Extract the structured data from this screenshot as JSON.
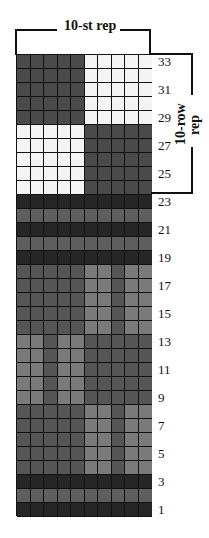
{
  "chart": {
    "column_rep_label": "10-st rep",
    "row_rep_label_line1": "10-row",
    "row_rep_label_line2": "rep",
    "columns": 10,
    "rows": 33,
    "row_labels": [
      "33",
      "31",
      "29",
      "27",
      "25",
      "23",
      "21",
      "19",
      "17",
      "15",
      "13",
      "11",
      "9",
      "7",
      "5",
      "3",
      "1"
    ]
  },
  "colors": {
    "white": "#f4f4f4",
    "dark": "#4a4a4a",
    "very_dark": "#262626",
    "medium": "#5e5e5e",
    "light": "#7a7a7a",
    "mid_dark": "#555555",
    "grid_line": "#111111"
  },
  "pattern_rows_top_to_bottom": [
    {
      "row": 33,
      "cells": [
        "dark",
        "dark",
        "dark",
        "dark",
        "dark",
        "white",
        "white",
        "white",
        "white",
        "white"
      ]
    },
    {
      "row": 32,
      "cells": [
        "dark",
        "dark",
        "dark",
        "dark",
        "dark",
        "white",
        "white",
        "white",
        "white",
        "white"
      ]
    },
    {
      "row": 31,
      "cells": [
        "dark",
        "dark",
        "dark",
        "dark",
        "dark",
        "white",
        "white",
        "white",
        "white",
        "white"
      ]
    },
    {
      "row": 30,
      "cells": [
        "dark",
        "dark",
        "dark",
        "dark",
        "dark",
        "white",
        "white",
        "white",
        "white",
        "white"
      ]
    },
    {
      "row": 29,
      "cells": [
        "dark",
        "dark",
        "dark",
        "dark",
        "dark",
        "white",
        "white",
        "white",
        "white",
        "white"
      ]
    },
    {
      "row": 28,
      "cells": [
        "white",
        "white",
        "white",
        "white",
        "white",
        "dark",
        "dark",
        "dark",
        "dark",
        "dark"
      ]
    },
    {
      "row": 27,
      "cells": [
        "white",
        "white",
        "white",
        "white",
        "white",
        "dark",
        "dark",
        "dark",
        "dark",
        "dark"
      ]
    },
    {
      "row": 26,
      "cells": [
        "white",
        "white",
        "white",
        "white",
        "white",
        "dark",
        "dark",
        "dark",
        "dark",
        "dark"
      ]
    },
    {
      "row": 25,
      "cells": [
        "white",
        "white",
        "white",
        "white",
        "white",
        "dark",
        "dark",
        "dark",
        "dark",
        "dark"
      ]
    },
    {
      "row": 24,
      "cells": [
        "white",
        "white",
        "white",
        "white",
        "white",
        "dark",
        "dark",
        "dark",
        "dark",
        "dark"
      ]
    },
    {
      "row": 23,
      "cells": [
        "very_dark",
        "very_dark",
        "very_dark",
        "very_dark",
        "very_dark",
        "very_dark",
        "very_dark",
        "very_dark",
        "very_dark",
        "very_dark"
      ]
    },
    {
      "row": 22,
      "cells": [
        "medium",
        "medium",
        "medium",
        "medium",
        "medium",
        "medium",
        "medium",
        "medium",
        "medium",
        "medium"
      ]
    },
    {
      "row": 21,
      "cells": [
        "very_dark",
        "very_dark",
        "very_dark",
        "very_dark",
        "very_dark",
        "very_dark",
        "very_dark",
        "very_dark",
        "very_dark",
        "very_dark"
      ]
    },
    {
      "row": 20,
      "cells": [
        "medium",
        "medium",
        "medium",
        "medium",
        "medium",
        "medium",
        "medium",
        "medium",
        "medium",
        "medium"
      ]
    },
    {
      "row": 19,
      "cells": [
        "very_dark",
        "very_dark",
        "very_dark",
        "very_dark",
        "very_dark",
        "very_dark",
        "very_dark",
        "very_dark",
        "very_dark",
        "very_dark"
      ]
    },
    {
      "row": 18,
      "cells": [
        "mid_dark",
        "mid_dark",
        "mid_dark",
        "mid_dark",
        "mid_dark",
        "light",
        "light",
        "mid_dark",
        "light",
        "light"
      ]
    },
    {
      "row": 17,
      "cells": [
        "mid_dark",
        "mid_dark",
        "mid_dark",
        "mid_dark",
        "mid_dark",
        "light",
        "light",
        "mid_dark",
        "light",
        "light"
      ]
    },
    {
      "row": 16,
      "cells": [
        "mid_dark",
        "mid_dark",
        "mid_dark",
        "mid_dark",
        "mid_dark",
        "light",
        "light",
        "mid_dark",
        "light",
        "light"
      ]
    },
    {
      "row": 15,
      "cells": [
        "mid_dark",
        "mid_dark",
        "mid_dark",
        "mid_dark",
        "mid_dark",
        "light",
        "light",
        "mid_dark",
        "light",
        "light"
      ]
    },
    {
      "row": 14,
      "cells": [
        "mid_dark",
        "mid_dark",
        "mid_dark",
        "mid_dark",
        "mid_dark",
        "light",
        "light",
        "mid_dark",
        "light",
        "light"
      ]
    },
    {
      "row": 13,
      "cells": [
        "light",
        "light",
        "mid_dark",
        "light",
        "light",
        "mid_dark",
        "mid_dark",
        "mid_dark",
        "mid_dark",
        "mid_dark"
      ]
    },
    {
      "row": 12,
      "cells": [
        "light",
        "light",
        "mid_dark",
        "light",
        "light",
        "mid_dark",
        "mid_dark",
        "mid_dark",
        "mid_dark",
        "mid_dark"
      ]
    },
    {
      "row": 11,
      "cells": [
        "light",
        "light",
        "mid_dark",
        "light",
        "light",
        "mid_dark",
        "mid_dark",
        "mid_dark",
        "mid_dark",
        "mid_dark"
      ]
    },
    {
      "row": 10,
      "cells": [
        "light",
        "light",
        "mid_dark",
        "light",
        "light",
        "mid_dark",
        "mid_dark",
        "mid_dark",
        "mid_dark",
        "mid_dark"
      ]
    },
    {
      "row": 9,
      "cells": [
        "light",
        "light",
        "mid_dark",
        "light",
        "light",
        "mid_dark",
        "mid_dark",
        "mid_dark",
        "mid_dark",
        "mid_dark"
      ]
    },
    {
      "row": 8,
      "cells": [
        "mid_dark",
        "mid_dark",
        "mid_dark",
        "mid_dark",
        "mid_dark",
        "light",
        "light",
        "mid_dark",
        "light",
        "light"
      ]
    },
    {
      "row": 7,
      "cells": [
        "mid_dark",
        "mid_dark",
        "mid_dark",
        "mid_dark",
        "mid_dark",
        "light",
        "light",
        "mid_dark",
        "light",
        "light"
      ]
    },
    {
      "row": 6,
      "cells": [
        "mid_dark",
        "mid_dark",
        "mid_dark",
        "mid_dark",
        "mid_dark",
        "light",
        "light",
        "mid_dark",
        "light",
        "light"
      ]
    },
    {
      "row": 5,
      "cells": [
        "mid_dark",
        "mid_dark",
        "mid_dark",
        "mid_dark",
        "mid_dark",
        "light",
        "light",
        "mid_dark",
        "light",
        "light"
      ]
    },
    {
      "row": 4,
      "cells": [
        "mid_dark",
        "mid_dark",
        "mid_dark",
        "mid_dark",
        "mid_dark",
        "light",
        "light",
        "mid_dark",
        "light",
        "light"
      ]
    },
    {
      "row": 3,
      "cells": [
        "very_dark",
        "very_dark",
        "very_dark",
        "very_dark",
        "very_dark",
        "very_dark",
        "very_dark",
        "very_dark",
        "very_dark",
        "very_dark"
      ]
    },
    {
      "row": 2,
      "cells": [
        "medium",
        "medium",
        "medium",
        "medium",
        "medium",
        "medium",
        "medium",
        "medium",
        "medium",
        "medium"
      ]
    },
    {
      "row": 1,
      "cells": [
        "very_dark",
        "very_dark",
        "very_dark",
        "very_dark",
        "very_dark",
        "very_dark",
        "very_dark",
        "very_dark",
        "very_dark",
        "very_dark"
      ]
    }
  ]
}
